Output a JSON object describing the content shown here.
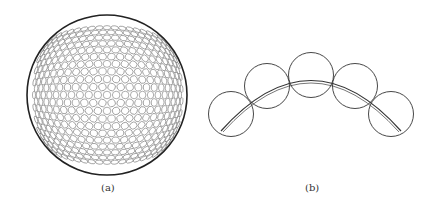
{
  "figure": {
    "panel_a": {
      "label": "(a)",
      "description": "sphere tiled with small circles",
      "stroke_color": "#222222",
      "dimple_color": "#888888"
    },
    "panel_b": {
      "label": "(b)",
      "description": "five overlapping circles along an arc",
      "circle_count": 5,
      "stroke_color": "#333333"
    }
  }
}
